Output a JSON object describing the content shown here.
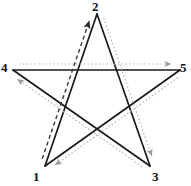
{
  "figure": {
    "shape_name": "pentagram",
    "background_color": "#ffffff",
    "solid_stroke_color": "#1a1a1a",
    "dashed_stroke_color": "#3a3a3a",
    "dotted_stroke_color": "#b8b8b8",
    "label_color": "#111111"
  },
  "vertices": [
    {
      "id": "1",
      "label": "1",
      "x": 45,
      "y": 166,
      "label_x": 33,
      "label_y": 171,
      "name": "vertex-1-bottom-left"
    },
    {
      "id": "2",
      "label": "2",
      "x": 97,
      "y": 14,
      "label_x": 92,
      "label_y": 0,
      "name": "vertex-2-top"
    },
    {
      "id": "3",
      "label": "3",
      "x": 150,
      "y": 166,
      "label_x": 152,
      "label_y": 171,
      "name": "vertex-3-bottom-right"
    },
    {
      "id": "4",
      "label": "4",
      "x": 13,
      "y": 70,
      "label_x": 1,
      "label_y": 62,
      "name": "vertex-4-left"
    },
    {
      "id": "5",
      "label": "5",
      "x": 180,
      "y": 70,
      "label_x": 180,
      "label_y": 62,
      "name": "vertex-5-right"
    }
  ],
  "solid_edges": [
    {
      "from": "1",
      "to": "2",
      "name": "edge-1-to-2"
    },
    {
      "from": "2",
      "to": "3",
      "name": "edge-2-to-3"
    },
    {
      "from": "3",
      "to": "4",
      "name": "edge-3-to-4"
    },
    {
      "from": "4",
      "to": "5",
      "name": "edge-4-to-5"
    },
    {
      "from": "5",
      "to": "1",
      "name": "edge-5-to-1"
    }
  ],
  "path_arrows": [
    {
      "from": "1",
      "to": "2",
      "style": "dashed",
      "color": "#3a3a3a",
      "offset": -5,
      "name": "path-arrow-1-to-2"
    },
    {
      "from": "2",
      "to": "3",
      "style": "dotted",
      "color": "#b8b8b8",
      "offset": -5,
      "name": "path-arrow-2-to-3"
    },
    {
      "from": "3",
      "to": "4",
      "style": "dotted",
      "color": "#b8b8b8",
      "offset": -5,
      "name": "path-arrow-3-to-4"
    },
    {
      "from": "4",
      "to": "5",
      "style": "dotted",
      "color": "#b8b8b8",
      "offset": -6,
      "name": "path-arrow-4-to-5"
    },
    {
      "from": "5",
      "to": "1",
      "style": "dotted",
      "color": "#b8b8b8",
      "offset": -5,
      "name": "path-arrow-5-to-1"
    }
  ],
  "traversal_order": "1 → 2 → 3 → 4 → 5 → 1"
}
